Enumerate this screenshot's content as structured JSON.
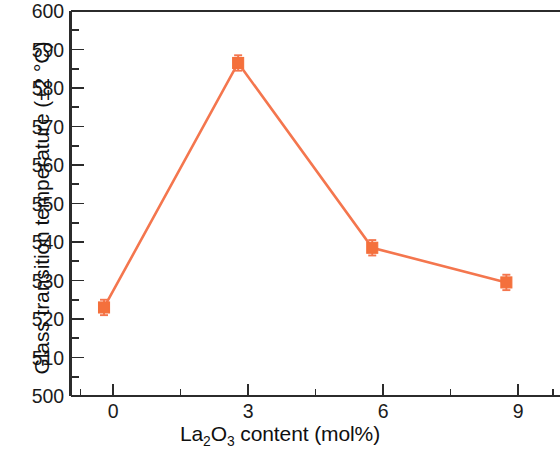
{
  "figure": {
    "background_color": "#ffffff",
    "axis_color": "#2b2b2b",
    "series_color": "#f4764e",
    "marker_color": "#f4703c",
    "width": 560,
    "height": 457
  },
  "axes": {
    "y_title_prefix": "Glass transition temperature (±2 ",
    "y_title_unit": "°C)",
    "x_title_part1": "La",
    "x_title_sub1": "2",
    "x_title_part2": "O",
    "x_title_sub2": "3",
    "x_title_part3": " content (mol%)",
    "y_ticks": [
      "600",
      "590",
      "580",
      "570",
      "560",
      "550",
      "540",
      "530",
      "520",
      "510",
      "500"
    ],
    "x_ticks": [
      "0",
      "3",
      "6",
      "9"
    ]
  },
  "chart_data": {
    "type": "line",
    "title": "",
    "xlabel": "La2O3 content (mol%)",
    "ylabel": "Glass transition temperature (±2 °C)",
    "x": [
      0,
      3,
      6,
      9
    ],
    "values": [
      523.0,
      586.5,
      538.5,
      529.5
    ],
    "yerr": [
      2,
      2,
      2,
      2
    ],
    "series": [
      {
        "name": "Glass transition temperature",
        "x": [
          0,
          3,
          6,
          9
        ],
        "values": [
          523.0,
          586.5,
          538.5,
          529.5
        ],
        "yerr": [
          2,
          2,
          2,
          2
        ],
        "color": "#f4764e",
        "marker": "square"
      }
    ],
    "xlim": [
      -0.75,
      10.2
    ],
    "ylim": [
      500,
      600
    ],
    "y_major_step": 10,
    "y_minor_step": 5,
    "x_major_step": 3,
    "x_minor_step": 1.5,
    "grid": false,
    "legend": null,
    "annotations": [],
    "axis_spines": [
      "left",
      "top",
      "bottom"
    ],
    "tick_direction": "in"
  }
}
